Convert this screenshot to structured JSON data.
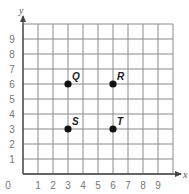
{
  "chart_data": {
    "type": "scatter",
    "title": "",
    "xlabel": "x",
    "ylabel": "y",
    "xlim": [
      0,
      10
    ],
    "ylim": [
      0,
      10
    ],
    "grid": true,
    "x_ticks": [
      "0",
      "1",
      "2",
      "3",
      "4",
      "5",
      "6",
      "7",
      "8",
      "9"
    ],
    "y_ticks": [
      "1",
      "2",
      "3",
      "4",
      "5",
      "6",
      "7",
      "8",
      "9"
    ],
    "points": [
      {
        "label": "Q",
        "x": 3,
        "y": 6
      },
      {
        "label": "R",
        "x": 6,
        "y": 6
      },
      {
        "label": "S",
        "x": 3,
        "y": 3
      },
      {
        "label": "T",
        "x": 6,
        "y": 3
      }
    ],
    "colors": {
      "grid": "#8a8a8a",
      "point": "#111111",
      "tick_text": "#777777"
    }
  }
}
